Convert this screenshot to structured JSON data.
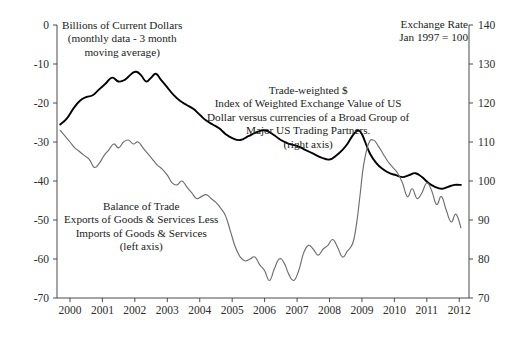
{
  "chart_data": {
    "type": "line",
    "title": "",
    "xlabel": "",
    "grid": false,
    "legend_position": "inline-annotations",
    "x_ticks": [
      "2000",
      "2001",
      "2002",
      "2003",
      "2004",
      "2005",
      "2006",
      "2007",
      "2008",
      "2009",
      "2010",
      "2011",
      "2012"
    ],
    "xlim": [
      1999.6,
      2012.3
    ],
    "left_axis": {
      "label": "Billions of Current Dollars",
      "ylim": [
        -70,
        0
      ],
      "ticks": [
        0,
        -10,
        -20,
        -30,
        -40,
        -50,
        -60,
        -70
      ],
      "tick_labels": [
        "0",
        "-10",
        "-20",
        "-30",
        "-40",
        "-50",
        "-60",
        "-70"
      ]
    },
    "right_axis": {
      "label": "Exchange Rate",
      "ylim": [
        70,
        140
      ],
      "ticks": [
        140,
        130,
        120,
        110,
        100,
        90,
        80,
        70
      ],
      "tick_labels": [
        "140",
        "130",
        "120",
        "110",
        "100",
        "90",
        "80",
        "70"
      ]
    },
    "series": [
      {
        "name": "Trade-weighted Dollar Index",
        "axis": "right",
        "color": "#000000",
        "x": [
          1999.7,
          1999.9,
          2000.1,
          2000.3,
          2000.5,
          2000.7,
          2000.9,
          2001.1,
          2001.3,
          2001.5,
          2001.7,
          2001.9,
          2002.05,
          2002.2,
          2002.35,
          2002.5,
          2002.65,
          2002.8,
          2003.0,
          2003.2,
          2003.4,
          2003.6,
          2003.8,
          2004.0,
          2004.2,
          2004.4,
          2004.6,
          2004.8,
          2005.0,
          2005.25,
          2005.5,
          2005.75,
          2006.0,
          2006.25,
          2006.5,
          2006.75,
          2007.0,
          2007.25,
          2007.5,
          2007.75,
          2008.0,
          2008.2,
          2008.4,
          2008.55,
          2008.7,
          2008.8,
          2008.9,
          2009.0,
          2009.1,
          2009.25,
          2009.45,
          2009.65,
          2009.85,
          2010.05,
          2010.25,
          2010.45,
          2010.65,
          2010.85,
          2011.05,
          2011.25,
          2011.45,
          2011.65,
          2011.85,
          2012.05
        ],
        "values": [
          114.5,
          116.0,
          118.5,
          120.5,
          121.5,
          122.0,
          123.5,
          125.0,
          126.5,
          125.5,
          126.0,
          127.5,
          128.0,
          127.0,
          125.5,
          126.5,
          127.5,
          126.0,
          124.0,
          122.0,
          120.5,
          119.5,
          118.5,
          117.0,
          115.5,
          114.5,
          113.5,
          112.0,
          111.0,
          110.5,
          111.5,
          112.5,
          113.0,
          112.0,
          110.5,
          109.5,
          109.0,
          108.0,
          107.0,
          106.0,
          105.5,
          106.5,
          108.0,
          109.5,
          111.5,
          112.5,
          113.0,
          112.0,
          110.0,
          107.0,
          104.5,
          103.0,
          102.0,
          101.5,
          101.0,
          101.5,
          102.0,
          101.0,
          99.5,
          98.5,
          98.0,
          98.5,
          99.0,
          99.0
        ]
      },
      {
        "name": "Balance of Trade",
        "axis": "left",
        "color": "#6e6e6e",
        "x": [
          1999.7,
          1999.85,
          2000.0,
          2000.15,
          2000.3,
          2000.45,
          2000.6,
          2000.75,
          2000.9,
          2001.05,
          2001.2,
          2001.35,
          2001.5,
          2001.65,
          2001.8,
          2001.95,
          2002.1,
          2002.25,
          2002.4,
          2002.55,
          2002.7,
          2002.85,
          2003.0,
          2003.15,
          2003.3,
          2003.45,
          2003.6,
          2003.75,
          2003.9,
          2004.05,
          2004.2,
          2004.35,
          2004.5,
          2004.65,
          2004.8,
          2004.95,
          2005.1,
          2005.25,
          2005.4,
          2005.55,
          2005.7,
          2005.85,
          2006.0,
          2006.15,
          2006.3,
          2006.45,
          2006.6,
          2006.75,
          2006.9,
          2007.05,
          2007.2,
          2007.35,
          2007.5,
          2007.65,
          2007.8,
          2007.95,
          2008.1,
          2008.25,
          2008.4,
          2008.55,
          2008.65,
          2008.75,
          2008.85,
          2008.95,
          2009.05,
          2009.2,
          2009.35,
          2009.5,
          2009.65,
          2009.8,
          2009.95,
          2010.1,
          2010.25,
          2010.4,
          2010.55,
          2010.7,
          2010.85,
          2011.0,
          2011.15,
          2011.3,
          2011.45,
          2011.6,
          2011.75,
          2011.9,
          2012.05
        ],
        "values": [
          -27.0,
          -28.5,
          -30.0,
          -31.5,
          -32.5,
          -33.5,
          -34.5,
          -36.5,
          -35.5,
          -33.5,
          -32.0,
          -30.5,
          -31.5,
          -30.0,
          -29.5,
          -30.5,
          -30.0,
          -31.5,
          -33.0,
          -34.5,
          -36.0,
          -37.0,
          -38.5,
          -40.5,
          -41.0,
          -40.0,
          -41.5,
          -43.0,
          -44.5,
          -44.0,
          -43.5,
          -44.5,
          -45.5,
          -47.0,
          -49.0,
          -53.0,
          -57.0,
          -59.5,
          -60.5,
          -60.0,
          -59.5,
          -61.5,
          -63.0,
          -65.5,
          -62.5,
          -60.0,
          -61.0,
          -64.0,
          -65.5,
          -63.0,
          -58.5,
          -56.5,
          -57.5,
          -59.0,
          -57.5,
          -56.5,
          -55.0,
          -57.0,
          -59.5,
          -58.0,
          -57.0,
          -55.0,
          -50.0,
          -43.0,
          -36.0,
          -30.5,
          -29.5,
          -31.0,
          -33.0,
          -35.0,
          -36.5,
          -38.0,
          -40.5,
          -44.0,
          -42.0,
          -44.5,
          -43.0,
          -40.5,
          -42.5,
          -46.0,
          -44.0,
          -47.5,
          -50.5,
          -48.5,
          -52.0
        ]
      }
    ],
    "annotations": {
      "units_note": "Billions of Current Dollars\n(monthly data - 3 month\nmoving average)",
      "exchange_note": "Trade-weighted $\nIndex of Weighted Exchange Value of US\nDollar versus currencies of a Broad Group of\nMajor US Trading Partners.\n(right axis)",
      "balance_note": "Balance of Trade\nExports of Goods & Services Less\nImports of Goods & Services\n(left axis)",
      "right_header": "Exchange Rate\nJan 1997 = 100"
    }
  },
  "colors": {
    "exchange_line": "#000000",
    "balance_line": "#6e6e6e",
    "axis": "#4a4a4a",
    "background": "#ffffff"
  }
}
